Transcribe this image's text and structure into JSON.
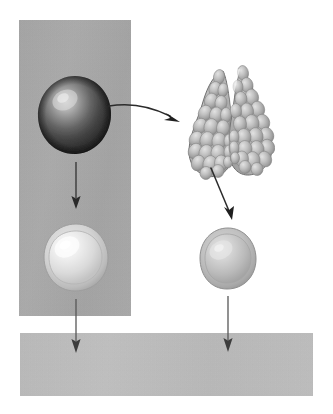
{
  "diagram": {
    "background_color": "#ffffff",
    "panels": [
      {
        "name": "left-vertical-column",
        "label": "vertical gray column panel",
        "color": "#a8a8a8",
        "x": 19,
        "y": 20,
        "width": 112,
        "height": 296
      },
      {
        "name": "bottom-horizontal-bar",
        "label": "horizontal gray bar panel",
        "color": "#bdbdbd",
        "x": 20,
        "y": 333,
        "width": 293,
        "height": 63
      }
    ],
    "figures": [
      {
        "name": "dark-cell",
        "label": "Dark shaded round cell",
        "shape": "sphere",
        "fill_color": "#3a3a3a",
        "highlight_color": "#c8c8c8",
        "cx": 74,
        "cy": 114,
        "rx": 34,
        "ry": 36
      },
      {
        "name": "gland",
        "label": "Bilobed lobulated gland",
        "shape": "bilobed-gland",
        "fill_color": "#b7b7b7",
        "outline_color": "#6f6f6f",
        "cx": 229,
        "cy": 122,
        "width": 88,
        "height": 130
      },
      {
        "name": "pale-cell-left",
        "label": "Pale rimmed round cell",
        "shape": "sphere-with-rim",
        "fill_color": "#d7d7d7",
        "rim_color": "#b0b0b0",
        "highlight_color": "#f2f2f2",
        "cx": 75,
        "cy": 257,
        "rx": 31,
        "ry": 32
      },
      {
        "name": "pale-cell-right",
        "label": "Medium gray round cell",
        "shape": "sphere",
        "fill_color": "#b8b8b8",
        "rim_color": "#9a9a9a",
        "highlight_color": "#dcdcdc",
        "cx": 227,
        "cy": 258,
        "rx": 28,
        "ry": 30
      }
    ],
    "arrows": [
      {
        "name": "arrow-dark-cell-to-gland",
        "label": "Curved arrow from dark cell to gland",
        "style": "curved",
        "color": "#2e2e2e",
        "from": {
          "x": 112,
          "y": 105
        },
        "to": {
          "x": 180,
          "y": 118
        }
      },
      {
        "name": "arrow-dark-cell-down",
        "label": "Arrow from dark cell down to pale cell",
        "style": "straight-vertical",
        "color": "#3a3a3a",
        "from": {
          "x": 75,
          "y": 162
        },
        "to": {
          "x": 75,
          "y": 208
        }
      },
      {
        "name": "arrow-gland-to-cell",
        "label": "Diagonal arrow from gland down to right cell",
        "style": "straight-diagonal",
        "color": "#2e2e2e",
        "from": {
          "x": 213,
          "y": 170
        },
        "to": {
          "x": 231,
          "y": 220
        }
      },
      {
        "name": "arrow-pale-cell-left-down",
        "label": "Arrow from left pale cell down to bottom bar",
        "style": "straight-vertical",
        "color": "#555555",
        "from": {
          "x": 75,
          "y": 300
        },
        "to": {
          "x": 75,
          "y": 351
        }
      },
      {
        "name": "arrow-pale-cell-right-down",
        "label": "Arrow from right cell down to bottom bar",
        "style": "straight-vertical",
        "color": "#555555",
        "from": {
          "x": 227,
          "y": 297
        },
        "to": {
          "x": 227,
          "y": 351
        }
      }
    ]
  }
}
